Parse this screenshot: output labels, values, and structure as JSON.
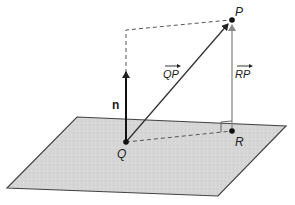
{
  "diagram": {
    "points": {
      "P": {
        "label": "P",
        "x": 232,
        "y": 20
      },
      "Q": {
        "label": "Q",
        "x": 126,
        "y": 142
      },
      "R": {
        "label": "R",
        "x": 232,
        "y": 131
      }
    },
    "vectors": {
      "QP": {
        "label": "QP",
        "arrow": "→"
      },
      "RP": {
        "label": "RP",
        "arrow": "→"
      },
      "n": {
        "label": "n"
      }
    },
    "plane": {
      "fill": "#d4d4d4",
      "stroke": "#444444"
    },
    "colors": {
      "dark": "#222222",
      "gray": "#8a8a8a",
      "dash": "#555555"
    }
  }
}
